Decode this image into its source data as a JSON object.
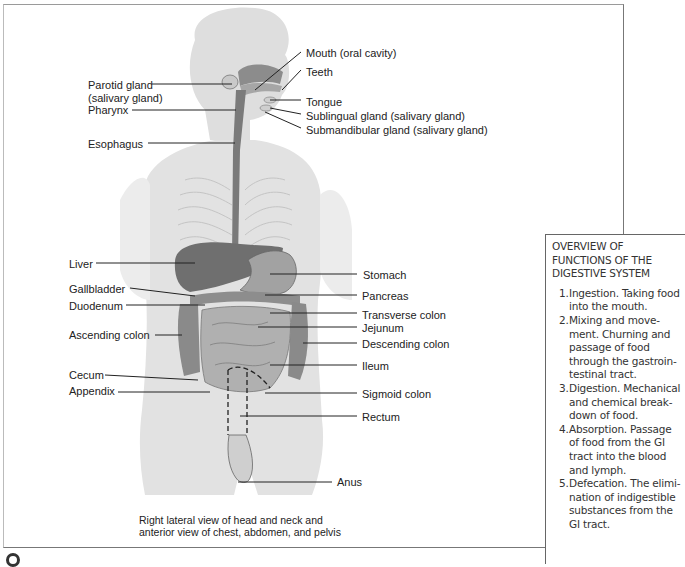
{
  "figure": {
    "caption_line1": "Right lateral view of head and neck and",
    "caption_line2": "anterior view of chest, abdomen, and pelvis",
    "labels_left": [
      {
        "text": "Parotid gland",
        "x": 88,
        "y": 79
      },
      {
        "text": "(salivary gland)",
        "x": 88,
        "y": 92
      },
      {
        "text": "Pharynx",
        "x": 88,
        "y": 104
      },
      {
        "text": "Esophagus",
        "x": 88,
        "y": 138
      },
      {
        "text": "Liver",
        "x": 69,
        "y": 258
      },
      {
        "text": "Gallbladder",
        "x": 69,
        "y": 283
      },
      {
        "text": "Duodenum",
        "x": 69,
        "y": 300
      },
      {
        "text": "Ascending colon",
        "x": 69,
        "y": 329
      },
      {
        "text": "Cecum",
        "x": 69,
        "y": 369
      },
      {
        "text": "Appendix",
        "x": 69,
        "y": 385
      }
    ],
    "labels_right": [
      {
        "text": "Mouth (oral cavity)",
        "x": 306,
        "y": 47
      },
      {
        "text": "Teeth",
        "x": 306,
        "y": 66
      },
      {
        "text": "Tongue",
        "x": 306,
        "y": 96
      },
      {
        "text": "Sublingual gland (salivary gland)",
        "x": 306,
        "y": 110
      },
      {
        "text": "Submandibular gland (salivary gland)",
        "x": 306,
        "y": 124
      },
      {
        "text": "Stomach",
        "x": 363,
        "y": 269
      },
      {
        "text": "Pancreas",
        "x": 362,
        "y": 290
      },
      {
        "text": "Transverse colon",
        "x": 362,
        "y": 309
      },
      {
        "text": "Jejunum",
        "x": 362,
        "y": 322
      },
      {
        "text": "Descending colon",
        "x": 362,
        "y": 338
      },
      {
        "text": "Ileum",
        "x": 362,
        "y": 360
      },
      {
        "text": "Sigmoid colon",
        "x": 362,
        "y": 388
      },
      {
        "text": "Rectum",
        "x": 362,
        "y": 411
      },
      {
        "text": "Anus",
        "x": 337,
        "y": 476
      }
    ]
  },
  "overview": {
    "title_line1": "OVERVIEW OF",
    "title_line2": "FUNCTIONS OF THE",
    "title_line3": "DIGESTIVE SYSTEM",
    "items": [
      {
        "num": "1.",
        "lines": [
          "Ingestion. Taking food",
          "into the mouth."
        ]
      },
      {
        "num": "2.",
        "lines": [
          "Mixing and move-",
          "ment. Churning and",
          "passage of food",
          "through the gastroin-",
          "testinal tract."
        ]
      },
      {
        "num": "3.",
        "lines": [
          "Digestion. Mechanical",
          "and chemical break-",
          "down of food."
        ]
      },
      {
        "num": "4.",
        "lines": [
          "Absorption. Passage",
          "of food from the GI",
          "tract into the blood",
          "and lymph."
        ]
      },
      {
        "num": "5.",
        "lines": [
          "Defecation. The elimi-",
          "nation of indigestible",
          "substances from the",
          "GI tract."
        ]
      }
    ]
  },
  "colors": {
    "body_fill": "#dcdcdc",
    "organ_dark": "#6e6e6e",
    "organ_mid": "#9a9a9a",
    "line": "#222222"
  }
}
